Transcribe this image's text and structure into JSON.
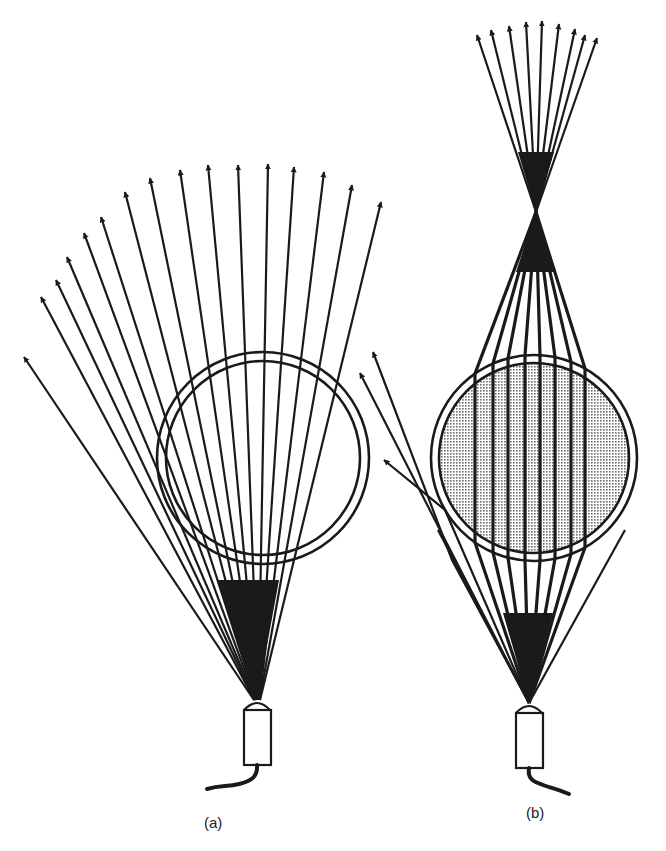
{
  "figure": {
    "panels": [
      {
        "id": "a",
        "label": "(a)",
        "description": "Diverging fan of light rays from a fiber-optic source passing through an empty spherical shell (thin double circle); rays continue diverging",
        "circle": {
          "cx": 263,
          "cy": 458,
          "r_outer": 106,
          "r_inner": 97,
          "filled": false
        },
        "source_apex": [
          257,
          700
        ],
        "ray_tips": [
          [
            24,
            357
          ],
          [
            41,
            297
          ],
          [
            56,
            280
          ],
          [
            67,
            257
          ],
          [
            84,
            233
          ],
          [
            101,
            217
          ],
          [
            125,
            192
          ],
          [
            150,
            178
          ],
          [
            180,
            170
          ],
          [
            208,
            165
          ],
          [
            238,
            165
          ],
          [
            268,
            164
          ],
          [
            294,
            167
          ],
          [
            324,
            172
          ],
          [
            352,
            185
          ],
          [
            381,
            202
          ]
        ]
      },
      {
        "id": "b",
        "label": "(b)",
        "description": "Light rays from a source pass through a filled (stippled) sphere acting as a lens; central rays run parallel through it and converge to a focal point above, then diverge; a few outer rays escape to the left",
        "circle": {
          "cx": 534,
          "cy": 458,
          "r_outer": 103,
          "r_inner": 95,
          "filled": true
        },
        "source_apex": [
          529,
          703
        ],
        "focus": [
          536,
          212
        ],
        "inner_ray_x": [
          475,
          493,
          508,
          525,
          540,
          555,
          571,
          585
        ],
        "ray_tips": [
          [
            477,
            35
          ],
          [
            491,
            30
          ],
          [
            509,
            26
          ],
          [
            526,
            22
          ],
          [
            542,
            21
          ],
          [
            559,
            24
          ],
          [
            575,
            29
          ],
          [
            585,
            35
          ],
          [
            597,
            38
          ]
        ],
        "escaping_ray_tips": [
          [
            373,
            352
          ],
          [
            360,
            373
          ],
          [
            384,
            460
          ]
        ]
      }
    ],
    "colors": {
      "ink": "#1a1a1a",
      "background": "#ffffff",
      "stipple": "#bdbdbd"
    }
  }
}
